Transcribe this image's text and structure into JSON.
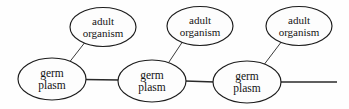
{
  "figure": {
    "background_color": "#fefefe",
    "stroke_color": "#1c1c1c",
    "text_color": "#141414",
    "width": 349,
    "height": 109
  },
  "nodes": [
    {
      "id": "germ-plasm-1",
      "type": "germ-plasm",
      "line1": "germ",
      "line2": "plasm",
      "cx": 52,
      "cy": 79,
      "rx": 34,
      "ry": 21,
      "font_size": 11.5
    },
    {
      "id": "germ-plasm-2",
      "type": "germ-plasm",
      "line1": "germ",
      "line2": "plasm",
      "cx": 152,
      "cy": 81,
      "rx": 34,
      "ry": 21,
      "font_size": 11.5
    },
    {
      "id": "germ-plasm-3",
      "type": "germ-plasm",
      "line1": "germ",
      "line2": "plasm",
      "cx": 247,
      "cy": 82,
      "rx": 34,
      "ry": 21,
      "font_size": 11.5
    },
    {
      "id": "adult-organism-1",
      "type": "adult-organism",
      "line1": "adult",
      "line2": "organism",
      "cx": 103,
      "cy": 27,
      "rx": 33,
      "ry": 19.5,
      "font_size": 11
    },
    {
      "id": "adult-organism-2",
      "type": "adult-organism",
      "line1": "adult",
      "line2": "organism",
      "cx": 200,
      "cy": 26,
      "rx": 33,
      "ry": 19.5,
      "font_size": 11
    },
    {
      "id": "adult-organism-3",
      "type": "adult-organism",
      "line1": "adult",
      "line2": "organism",
      "cx": 299,
      "cy": 26,
      "rx": 33,
      "ry": 19.5,
      "font_size": 11
    }
  ],
  "edges": [
    {
      "id": "edge-germ1-germ2",
      "kind": "horizontal",
      "from": "germ-plasm-1",
      "to": "germ-plasm-2",
      "x1": 84,
      "y1": 79,
      "x2": 120,
      "y2": 80
    },
    {
      "id": "edge-germ2-germ3",
      "kind": "horizontal",
      "from": "germ-plasm-2",
      "to": "germ-plasm-3",
      "x1": 185,
      "y1": 81,
      "x2": 215,
      "y2": 82
    },
    {
      "id": "edge-germ3-continuation",
      "kind": "horizontal-open",
      "from": "germ-plasm-3",
      "to": "",
      "x1": 280,
      "y1": 82,
      "x2": 337,
      "y2": 82
    },
    {
      "id": "edge-germ1-adult1",
      "kind": "diagonal",
      "from": "germ-plasm-1",
      "to": "adult-organism-1",
      "x1": 68,
      "y1": 64,
      "x2": 85,
      "y2": 42
    },
    {
      "id": "edge-germ2-adult2",
      "kind": "diagonal",
      "from": "germ-plasm-2",
      "to": "adult-organism-2",
      "x1": 167,
      "y1": 65,
      "x2": 182,
      "y2": 42
    },
    {
      "id": "edge-germ3-adult3",
      "kind": "diagonal",
      "from": "germ-plasm-3",
      "to": "adult-organism-3",
      "x1": 263,
      "y1": 66,
      "x2": 281,
      "y2": 42
    }
  ]
}
